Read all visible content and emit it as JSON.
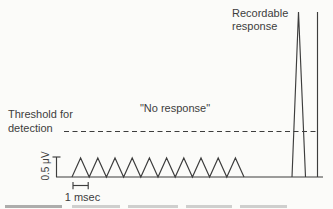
{
  "figure": {
    "labels": {
      "threshold_line1": "Threshold for",
      "threshold_line2": "detection",
      "no_response": "\"No response\"",
      "recordable_line1": "Recordable",
      "recordable_line2": "response",
      "amplitude_scale": "0.5 μV",
      "time_scale": "1 msec"
    },
    "colors": {
      "ink": "#3d3d3d",
      "background": "#fbfbf9"
    },
    "waveform": {
      "baseline_y": 177,
      "baseline_x0": 56,
      "baseline_x1": 323,
      "stimulus_count": 10,
      "train_x0": 72,
      "train_spacing": 17.2,
      "train_peak_y": 158,
      "threshold_y": 131.5,
      "threshold_x0": 64,
      "threshold_x1": 319,
      "spike": {
        "x_left": 292,
        "x_apex": 298.5,
        "x_right": 305.5,
        "apex_y": 12
      },
      "right_line": {
        "x": 317.5,
        "y_top": 12
      },
      "amp_bar": {
        "x": 56.5,
        "y_top": 157,
        "tick_x0": 52.5,
        "tick_x1": 60.5
      },
      "time_bracket": {
        "x0": 73,
        "x1": 88.2,
        "y": 185.5,
        "tick_y0": 182,
        "tick_y1": 189.2
      }
    }
  }
}
